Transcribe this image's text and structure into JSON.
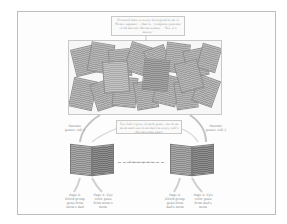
{
  "diagram": {
    "top_callout": "Pictured here is every biological book of ‘Homo sapiens’ – that is, ‘complete genome’ of all known chromosomes… ‘Yes, it’s messy.’",
    "mid_callout": "Two full copies of each gene, one from mom and one from dad (in every cell’s chromosome pair).",
    "left_arrow_label": "Parents' genes: cell 1",
    "right_arrow_label": "Parents' genes: cell 2",
    "center_arrow_label": "← Same sequence →",
    "bottom_labels": [
      {
        "text": "Page X: Blood group gene from mom's dad"
      },
      {
        "text": "Page X: Eye color gene from mom's mom"
      },
      {
        "text": "Page X: Blood group gene from dad's mom"
      },
      {
        "text": "Page X: Eye color gene from dad's mom"
      }
    ]
  }
}
